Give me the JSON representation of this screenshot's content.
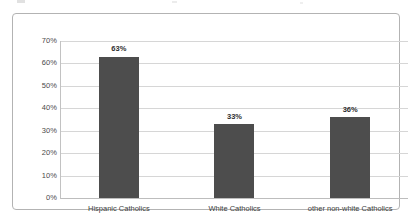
{
  "chart_data": {
    "type": "bar",
    "title": "",
    "subtitle": "",
    "xlabel": "",
    "ylabel": "",
    "categories": [
      "Hispanic Catholics",
      "White Catholics",
      "other non-white Catholics"
    ],
    "values": [
      63,
      33,
      36
    ],
    "value_labels": [
      "63%",
      "33%",
      "36%"
    ],
    "ylim": [
      0,
      70
    ],
    "ytick_values": [
      70,
      60,
      50,
      40,
      30,
      20,
      10,
      0
    ],
    "ytick_labels": [
      "70%",
      "60%",
      "50%",
      "40%",
      "30%",
      "20%",
      "10%",
      "0%"
    ],
    "grid": true,
    "legend": false,
    "legend_position": "none",
    "series": [
      {
        "name": "",
        "values": [
          63,
          33,
          36
        ]
      }
    ]
  },
  "style": {
    "bar_color": "#4d4d4d",
    "gridline_color": "#d6d6d6",
    "axis_color": "#c2c2c2",
    "frame_color": "#b3b3b3",
    "background": "#ffffff",
    "tick_text_color": "#4a4a4a",
    "label_text_color": "#3d3d3d",
    "value_label_color": "#2e2e2e"
  }
}
